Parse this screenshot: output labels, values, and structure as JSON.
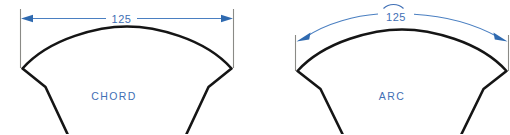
{
  "figures": [
    {
      "id": "chord",
      "caption": "CHORD",
      "dimension_value": "125",
      "dimension_type": "linear",
      "has_arc_symbol": false
    },
    {
      "id": "arc",
      "caption": "ARC",
      "dimension_value": "125",
      "dimension_type": "arc-length",
      "has_arc_symbol": true
    }
  ],
  "colors": {
    "annotation_blue": "#3f6fb5",
    "arrow_blue": "#2f6ab0",
    "dimension_line_blue": "#4a7fc1",
    "extension_line_gray": "#8a8a86",
    "part_outline_black": "#151515",
    "background": "#ffffff"
  }
}
